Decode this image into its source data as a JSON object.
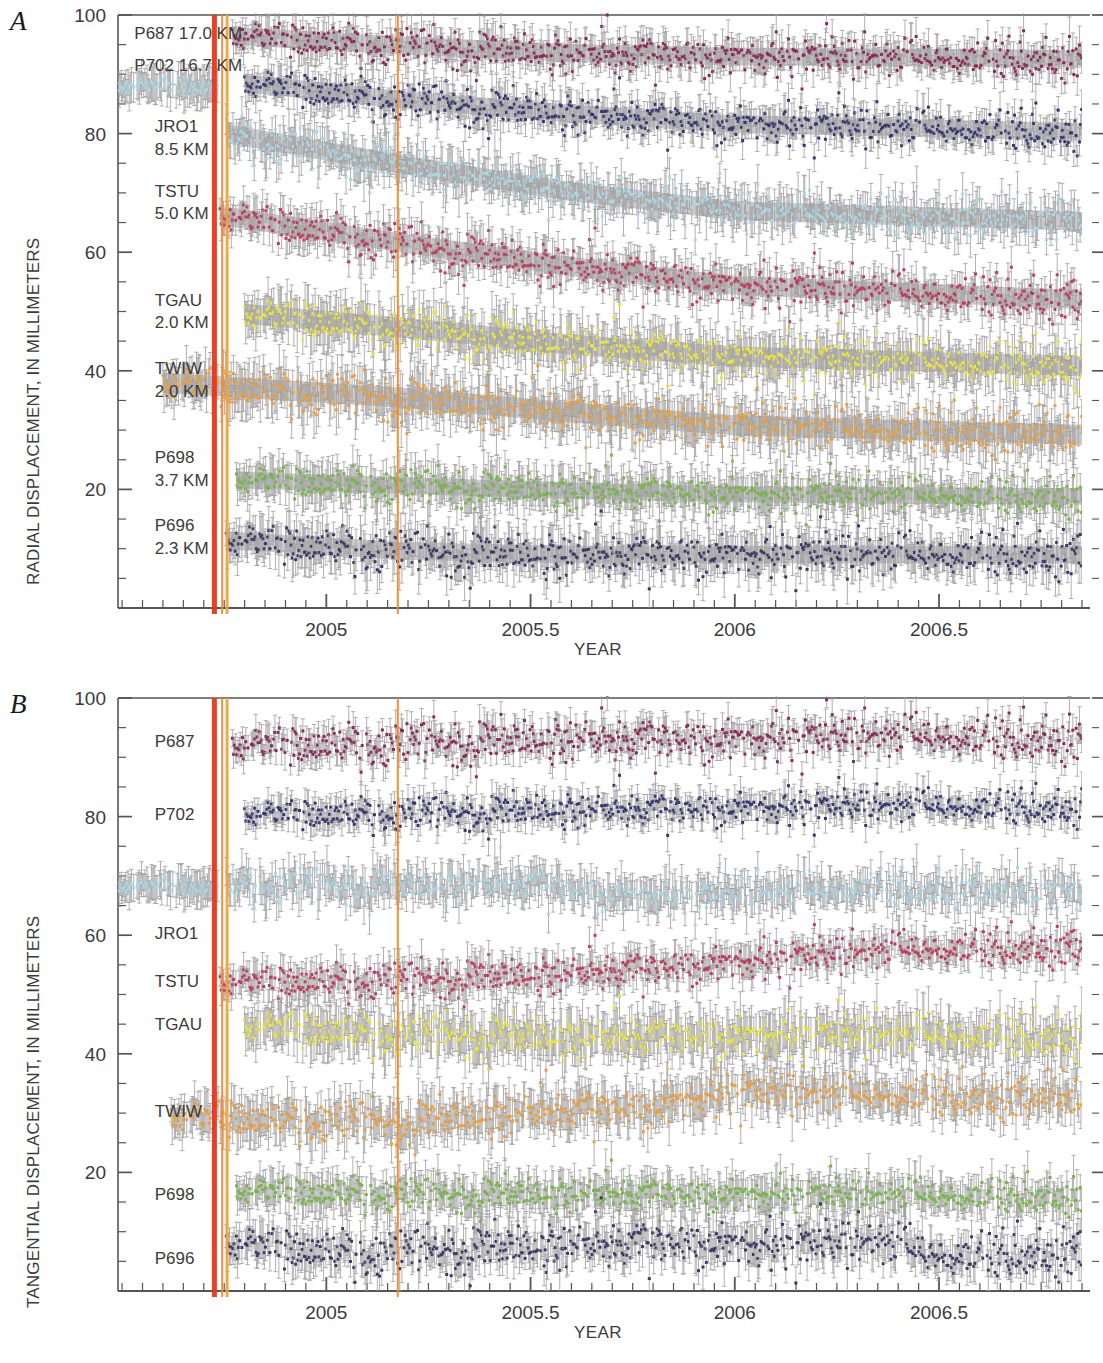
{
  "figure": {
    "panels": [
      {
        "id": "A",
        "letter": "A",
        "ylabel": "RADIAL DISPLACEMENT, IN MILLIMETERS",
        "xlabel": "YEAR",
        "ytick_labels": [
          "100",
          "80",
          "60",
          "40",
          "20"
        ],
        "ytick_values": [
          100,
          80,
          60,
          40,
          20
        ],
        "xtick_labels": [
          "2005",
          "2005.5",
          "2006",
          "2006.5"
        ],
        "xtick_values": [
          2005,
          2005.5,
          2006,
          2006.5
        ]
      },
      {
        "id": "B",
        "letter": "B",
        "ylabel": "TANGENTIAL DISPLACEMENT, IN MILLIMETERS",
        "xlabel": "YEAR",
        "ytick_labels": [
          "100",
          "80",
          "60",
          "40",
          "20"
        ],
        "ytick_values": [
          100,
          80,
          60,
          40,
          20
        ],
        "xtick_labels": [
          "2005",
          "2005.5",
          "2006",
          "2006.5"
        ],
        "xtick_values": [
          2005,
          2005.5,
          2006,
          2006.5
        ]
      }
    ]
  },
  "chart_data": [
    {
      "type": "scatter",
      "panel": "A",
      "title": "",
      "xlabel": "YEAR",
      "ylabel": "RADIAL DISPLACEMENT, IN MILLIMETERS",
      "xlim": [
        2004.49,
        2006.85
      ],
      "ylim": [
        0,
        100
      ],
      "xticks": [
        2005,
        2005.5,
        2006,
        2006.5
      ],
      "yticks": [
        20,
        40,
        60,
        80,
        100
      ],
      "minor_ytick_step": 5,
      "minor_xtick_step": 0.05,
      "grid": false,
      "legend": "inline-left-labels",
      "event_lines": [
        {
          "name": "eruption-onset",
          "x": 2004.726,
          "color": "#E8361C",
          "width_px": 5
        },
        {
          "name": "event-2",
          "x": 2004.745,
          "color": "#F28B30",
          "width_px": 2
        },
        {
          "name": "event-3",
          "x": 2004.757,
          "color": "#F5A03E",
          "width_px": 3
        },
        {
          "name": "event-4",
          "x": 2005.175,
          "color": "#F08A2E",
          "width_px": 2
        }
      ],
      "series": [
        {
          "name": "P687",
          "label": "P687 17.0 KM",
          "distance_km": 17.0,
          "color": "#8E2951",
          "offset": 96.0,
          "start": 2004.77,
          "end": 2006.85,
          "pre_offset": null,
          "trend": [
            [
              2004.77,
              96.5
            ],
            [
              2005.2,
              94.8
            ],
            [
              2005.6,
              93.6
            ],
            [
              2006.0,
              93.0
            ],
            [
              2006.85,
              92.6
            ]
          ],
          "scatter": 1.6,
          "err": 2.2,
          "band": 1.5
        },
        {
          "name": "P702",
          "label": "P702 16.7 KM",
          "distance_km": 16.7,
          "color": "#3A3472",
          "offset": 87.0,
          "start": 2004.8,
          "end": 2006.85,
          "pre_offset": null,
          "trend": [
            [
              2004.8,
              88.5
            ],
            [
              2005.2,
              85.6
            ],
            [
              2005.6,
              83.4
            ],
            [
              2006.0,
              81.6
            ],
            [
              2006.85,
              80.3
            ]
          ],
          "scatter": 1.6,
          "err": 2.2,
          "band": 1.5
        },
        {
          "name": "JRO1",
          "label": "JRO1 8.5 KM",
          "distance_km": 8.5,
          "color": "#A9D8E6",
          "offset": 78.0,
          "start": 2004.755,
          "end": 2006.85,
          "pre_offset": 88.0,
          "pre_start": 2004.49,
          "pre_end": 2004.735,
          "trend": [
            [
              2004.755,
              80.0
            ],
            [
              2005.2,
              74.6
            ],
            [
              2005.6,
              70.2
            ],
            [
              2006.0,
              67.0
            ],
            [
              2006.85,
              65.2
            ]
          ],
          "scatter": 1.7,
          "err": 2.4,
          "band": 1.6
        },
        {
          "name": "TSTU",
          "label": "TSTU 5.0 KM",
          "distance_km": 5.0,
          "color": "#C03A63",
          "offset": 64.0,
          "start": 2004.74,
          "end": 2006.85,
          "pre_offset": null,
          "trend": [
            [
              2004.74,
              66.2
            ],
            [
              2005.2,
              61.4
            ],
            [
              2005.6,
              57.6
            ],
            [
              2006.0,
              54.4
            ],
            [
              2006.85,
              52.0
            ]
          ],
          "scatter": 1.7,
          "err": 2.4,
          "band": 1.6
        },
        {
          "name": "TGAU",
          "label": "TGAU 2.0 KM",
          "distance_km": 2.0,
          "color": "#ECE63B",
          "offset": 48.0,
          "start": 2004.8,
          "end": 2006.85,
          "pre_offset": null,
          "trend": [
            [
              2004.8,
              49.6
            ],
            [
              2005.2,
              47.2
            ],
            [
              2005.6,
              44.4
            ],
            [
              2006.0,
              42.4
            ],
            [
              2006.85,
              40.8
            ]
          ],
          "scatter": 1.8,
          "err": 3.0,
          "band": 1.7
        },
        {
          "name": "TWIW",
          "label": "TWIW 2.0 KM",
          "distance_km": 2.0,
          "color": "#F0A03A",
          "offset": 36.0,
          "start": 2004.6,
          "end": 2006.85,
          "pre_offset": null,
          "trend": [
            [
              2004.6,
              38.0
            ],
            [
              2005.2,
              35.4
            ],
            [
              2005.6,
              33.0
            ],
            [
              2006.0,
              30.8
            ],
            [
              2006.85,
              29.2
            ]
          ],
          "scatter": 1.8,
          "err": 3.0,
          "band": 1.7
        },
        {
          "name": "P698",
          "label": "P698 3.7 KM",
          "distance_km": 3.7,
          "color": "#76B843",
          "offset": 20.5,
          "start": 2004.78,
          "end": 2006.85,
          "pre_offset": null,
          "trend": [
            [
              2004.78,
              21.6
            ],
            [
              2005.2,
              20.6
            ],
            [
              2005.6,
              19.8
            ],
            [
              2006.0,
              19.2
            ],
            [
              2006.85,
              18.8
            ]
          ],
          "scatter": 1.5,
          "err": 2.6,
          "band": 1.4
        },
        {
          "name": "P696",
          "label": "P696 2.3 KM",
          "distance_km": 2.3,
          "color": "#3E3766",
          "offset": 9.5,
          "start": 2004.755,
          "end": 2006.85,
          "pre_offset": null,
          "trend": [
            [
              2004.755,
              11.4
            ],
            [
              2005.2,
              9.6
            ],
            [
              2005.6,
              9.0
            ],
            [
              2006.0,
              9.0
            ],
            [
              2006.85,
              9.0
            ]
          ],
          "scatter": 1.8,
          "err": 2.8,
          "band": 1.5
        }
      ],
      "label_positions": [
        {
          "name": "P687",
          "text": "P687 17.0 KM",
          "x": 2004.53,
          "y": 97.0
        },
        {
          "name": "P702",
          "text": "P702 16.7 KM",
          "x": 2004.53,
          "y": 91.6
        },
        {
          "name": "JRO1",
          "text": "JRO1",
          "x": 2004.58,
          "y": 81.2
        },
        {
          "name": "JRO1-km",
          "text": "8.5 KM",
          "x": 2004.58,
          "y": 77.4
        },
        {
          "name": "TSTU",
          "text": "TSTU",
          "x": 2004.58,
          "y": 70.4
        },
        {
          "name": "TSTU-km",
          "text": "5.0 KM",
          "x": 2004.58,
          "y": 66.6
        },
        {
          "name": "TGAU",
          "text": "TGAU",
          "x": 2004.58,
          "y": 52.0
        },
        {
          "name": "TGAU-km",
          "text": "2.0 KM",
          "x": 2004.58,
          "y": 48.2
        },
        {
          "name": "TWIW",
          "text": "TWIW",
          "x": 2004.58,
          "y": 40.4
        },
        {
          "name": "TWIW-km",
          "text": "2.0 KM",
          "x": 2004.58,
          "y": 36.6
        },
        {
          "name": "P698",
          "text": "P698",
          "x": 2004.58,
          "y": 25.4
        },
        {
          "name": "P698-km",
          "text": "3.7 KM",
          "x": 2004.58,
          "y": 21.6
        },
        {
          "name": "P696",
          "text": "P696",
          "x": 2004.58,
          "y": 14.0
        },
        {
          "name": "P696-km",
          "text": "2.3 KM",
          "x": 2004.58,
          "y": 10.2
        }
      ]
    },
    {
      "type": "scatter",
      "panel": "B",
      "title": "",
      "xlabel": "YEAR",
      "ylabel": "TANGENTIAL DISPLACEMENT, IN MILLIMETERS",
      "xlim": [
        2004.49,
        2006.85
      ],
      "ylim": [
        0,
        100
      ],
      "xticks": [
        2005,
        2005.5,
        2006,
        2006.5
      ],
      "yticks": [
        20,
        40,
        60,
        80,
        100
      ],
      "minor_ytick_step": 5,
      "minor_xtick_step": 0.05,
      "grid": false,
      "legend": "inline-left-labels",
      "event_lines": [
        {
          "name": "eruption-onset",
          "x": 2004.726,
          "color": "#E8361C",
          "width_px": 5
        },
        {
          "name": "event-2",
          "x": 2004.745,
          "color": "#F28B30",
          "width_px": 2
        },
        {
          "name": "event-3",
          "x": 2004.757,
          "color": "#F5A03E",
          "width_px": 3
        },
        {
          "name": "event-4",
          "x": 2005.175,
          "color": "#F08A2E",
          "width_px": 2
        }
      ],
      "series": [
        {
          "name": "P687",
          "label": "P687",
          "color": "#8E2951",
          "offset": 92.5,
          "start": 2004.77,
          "end": 2006.85,
          "pre_offset": null,
          "trend": [
            [
              2004.77,
              92.0
            ],
            [
              2005.2,
              92.4
            ],
            [
              2005.6,
              93.2
            ],
            [
              2006.0,
              93.0
            ],
            [
              2006.4,
              93.6
            ],
            [
              2006.85,
              93.0
            ]
          ],
          "scatter": 1.8,
          "err": 2.0,
          "band": 0
        },
        {
          "name": "P702",
          "label": "P702",
          "color": "#3A3472",
          "offset": 81.0,
          "start": 2004.8,
          "end": 2006.85,
          "pre_offset": null,
          "trend": [
            [
              2004.8,
              80.4
            ],
            [
              2005.2,
              80.6
            ],
            [
              2005.6,
              81.2
            ],
            [
              2006.0,
              81.4
            ],
            [
              2006.4,
              81.8
            ],
            [
              2006.85,
              81.4
            ]
          ],
          "scatter": 1.4,
          "err": 1.9,
          "band": 0
        },
        {
          "name": "JRO1",
          "label": "JRO1",
          "color": "#A9D8E6",
          "offset": 68.0,
          "start": 2004.755,
          "end": 2006.85,
          "pre_offset": 68.2,
          "pre_start": 2004.49,
          "pre_end": 2004.735,
          "trend": [
            [
              2004.755,
              68.6
            ],
            [
              2005.2,
              68.4
            ],
            [
              2005.5,
              68.8
            ],
            [
              2005.72,
              66.6
            ],
            [
              2006.0,
              66.8
            ],
            [
              2006.3,
              68.0
            ],
            [
              2006.85,
              67.2
            ]
          ],
          "scatter": 1.5,
          "err": 2.2,
          "band": 0
        },
        {
          "name": "TSTU",
          "label": "TSTU",
          "color": "#C03A63",
          "offset": 53.0,
          "start": 2004.74,
          "end": 2006.85,
          "pre_offset": null,
          "trend": [
            [
              2004.74,
              52.0
            ],
            [
              2005.2,
              52.6
            ],
            [
              2005.6,
              53.6
            ],
            [
              2006.0,
              55.4
            ],
            [
              2006.4,
              57.6
            ],
            [
              2006.85,
              58.0
            ]
          ],
          "scatter": 1.5,
          "err": 2.2,
          "band": 0
        },
        {
          "name": "TGAU",
          "label": "TGAU",
          "color": "#ECE63B",
          "offset": 43.5,
          "start": 2004.8,
          "end": 2006.85,
          "pre_offset": null,
          "trend": [
            [
              2004.8,
              44.6
            ],
            [
              2005.2,
              43.4
            ],
            [
              2005.6,
              42.8
            ],
            [
              2006.0,
              43.0
            ],
            [
              2006.4,
              43.2
            ],
            [
              2006.85,
              42.8
            ]
          ],
          "scatter": 1.7,
          "err": 3.0,
          "band": 0
        },
        {
          "name": "TWIW",
          "label": "TWIW",
          "color": "#F0A03A",
          "offset": 30.0,
          "start": 2004.62,
          "end": 2006.85,
          "pre_offset": null,
          "trend": [
            [
              2004.62,
              29.4
            ],
            [
              2005.2,
              28.6
            ],
            [
              2005.5,
              30.2
            ],
            [
              2005.8,
              31.0
            ],
            [
              2006.0,
              33.6
            ],
            [
              2006.4,
              33.0
            ],
            [
              2006.85,
              32.6
            ]
          ],
          "scatter": 1.7,
          "err": 2.8,
          "band": 0
        },
        {
          "name": "P698",
          "label": "P698",
          "color": "#76B843",
          "offset": 16.5,
          "start": 2004.78,
          "end": 2006.85,
          "pre_offset": null,
          "trend": [
            [
              2004.78,
              16.8
            ],
            [
              2005.2,
              16.4
            ],
            [
              2005.6,
              16.4
            ],
            [
              2006.0,
              16.2
            ],
            [
              2006.85,
              16.0
            ]
          ],
          "scatter": 1.4,
          "err": 2.4,
          "band": 0
        },
        {
          "name": "P696",
          "label": "P696",
          "color": "#3E3766",
          "offset": 7.0,
          "start": 2004.755,
          "end": 2006.85,
          "pre_offset": null,
          "trend": [
            [
              2004.755,
              8.0
            ],
            [
              2005.1,
              6.4
            ],
            [
              2005.4,
              7.4
            ],
            [
              2005.8,
              8.2
            ],
            [
              2006.1,
              7.6
            ],
            [
              2006.35,
              8.4
            ],
            [
              2006.5,
              6.0
            ],
            [
              2006.85,
              6.4
            ]
          ],
          "scatter": 1.9,
          "err": 2.6,
          "band": 0
        }
      ],
      "label_positions": [
        {
          "name": "P687",
          "text": "P687",
          "x": 2004.58,
          "y": 92.8
        },
        {
          "name": "P702",
          "text": "P702",
          "x": 2004.58,
          "y": 80.4
        },
        {
          "name": "JRO1",
          "text": "JRO1",
          "x": 2004.58,
          "y": 60.4
        },
        {
          "name": "TSTU",
          "text": "TSTU",
          "x": 2004.58,
          "y": 52.2
        },
        {
          "name": "TGAU",
          "text": "TGAU",
          "x": 2004.58,
          "y": 45.0
        },
        {
          "name": "TWIW",
          "text": "TWIW",
          "x": 2004.58,
          "y": 30.4
        },
        {
          "name": "P698",
          "text": "P698",
          "x": 2004.58,
          "y": 16.4
        },
        {
          "name": "P696",
          "text": "P696",
          "x": 2004.58,
          "y": 5.6
        }
      ]
    }
  ],
  "style": {
    "axis_color": "#555555",
    "text_color": "#3b3b3b",
    "band_color": "#b0b0b0",
    "errbar_color": "#9a9a9a",
    "background": "#ffffff"
  }
}
